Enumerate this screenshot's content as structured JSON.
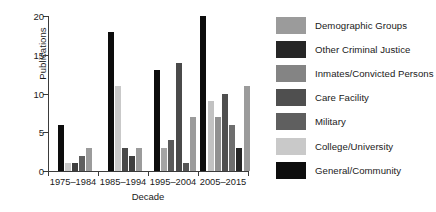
{
  "chart_data": {
    "type": "bar",
    "title": "",
    "xlabel": "Decade",
    "ylabel": "Publications",
    "ylim": [
      0,
      20
    ],
    "yticks": [
      0,
      5,
      10,
      15,
      20
    ],
    "grid": false,
    "legend_position": "right",
    "categories": [
      "1975–1984",
      "1985–1994",
      "1995–2004",
      "2005–2015"
    ],
    "series": [
      {
        "name": "Demographic Groups",
        "color": "#9b9b9b",
        "values": [
          0,
          0,
          3,
          7
        ]
      },
      {
        "name": "Other Criminal Justice",
        "color": "#262626",
        "values": [
          0,
          0,
          0,
          0
        ]
      },
      {
        "name": "Inmates/Convicted Persons",
        "color": "#848484",
        "values": [
          0,
          3,
          0,
          0
        ]
      },
      {
        "name": "Care Facility",
        "color": "#4f4f4f",
        "values": [
          1,
          2,
          4,
          10
        ]
      },
      {
        "name": "Military",
        "color": "#5f5f5f",
        "values": [
          2,
          0,
          14,
          6
        ]
      },
      {
        "name": "College/University",
        "color": "#c9c9c9",
        "values": [
          1,
          11,
          3,
          9
        ]
      },
      {
        "name": "General/Community",
        "color": "#0d0d0d",
        "values": [
          6,
          18,
          13,
          20
        ]
      }
    ],
    "bars": [
      {
        "group": 0,
        "series": "General/Community",
        "value": 6,
        "color": "#0d0d0d"
      },
      {
        "group": 0,
        "series": "College/University",
        "value": 1,
        "color": "#c9c9c9"
      },
      {
        "group": 0,
        "series": "Care Facility",
        "value": 1,
        "color": "#3f3f3f"
      },
      {
        "group": 0,
        "series": "Military",
        "value": 2,
        "color": "#5f5f5f"
      },
      {
        "group": 0,
        "series": "Demographic Groups",
        "value": 3,
        "color": "#9b9b9b"
      },
      {
        "group": 1,
        "series": "General/Community",
        "value": 18,
        "color": "#0d0d0d"
      },
      {
        "group": 1,
        "series": "College/University",
        "value": 11,
        "color": "#c9c9c9"
      },
      {
        "group": 1,
        "series": "Inmates/Convicted Persons",
        "value": 3,
        "color": "#4a4a4a"
      },
      {
        "group": 1,
        "series": "Care Facility",
        "value": 2,
        "color": "#3f3f3f"
      },
      {
        "group": 1,
        "series": "Demographic Groups",
        "value": 3,
        "color": "#9b9b9b"
      },
      {
        "group": 2,
        "series": "General/Community",
        "value": 13,
        "color": "#0d0d0d"
      },
      {
        "group": 2,
        "series": "Demographic Groups",
        "value": 3,
        "color": "#a5a5a5"
      },
      {
        "group": 2,
        "series": "Care Facility",
        "value": 4,
        "color": "#5a5a5a"
      },
      {
        "group": 2,
        "series": "Military",
        "value": 14,
        "color": "#4a4a4a"
      },
      {
        "group": 2,
        "series": "Other Criminal Justice",
        "value": 1,
        "color": "#555555"
      },
      {
        "group": 2,
        "series": "Demographic Groups 2",
        "value": 7,
        "color": "#9b9b9b"
      },
      {
        "group": 3,
        "series": "General/Community",
        "value": 20,
        "color": "#0d0d0d"
      },
      {
        "group": 3,
        "series": "College/University",
        "value": 9,
        "color": "#c2c2c2"
      },
      {
        "group": 3,
        "series": "Demographic Groups",
        "value": 7,
        "color": "#919191"
      },
      {
        "group": 3,
        "series": "Care Facility",
        "value": 10,
        "color": "#4f4f4f"
      },
      {
        "group": 3,
        "series": "Military",
        "value": 6,
        "color": "#6e6e6e"
      },
      {
        "group": 3,
        "series": "Other Criminal Justice",
        "value": 3,
        "color": "#262626"
      },
      {
        "group": 3,
        "series": "Demographic Groups 2",
        "value": 11,
        "color": "#9b9b9b"
      }
    ]
  },
  "axes": {
    "ylabel": "Publications",
    "xlabel": "Decade",
    "ytick_labels": [
      "0",
      "5",
      "10",
      "15",
      "20"
    ],
    "xtick_labels": [
      "1975–1984",
      "1985–1994",
      "1995–2004",
      "2005–2015"
    ]
  },
  "legend": {
    "items": [
      {
        "label": "Demographic Groups",
        "color": "#9b9b9b"
      },
      {
        "label": "Other Criminal Justice",
        "color": "#262626"
      },
      {
        "label": "Inmates/Convicted Persons",
        "color": "#848484"
      },
      {
        "label": "Care Facility",
        "color": "#4f4f4f"
      },
      {
        "label": "Military",
        "color": "#5f5f5f"
      },
      {
        "label": "College/University",
        "color": "#c9c9c9"
      },
      {
        "label": "General/Community",
        "color": "#0d0d0d"
      }
    ]
  }
}
